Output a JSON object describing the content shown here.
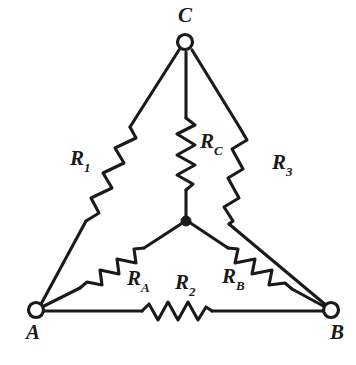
{
  "figure": {
    "kind": "circuit-diagram",
    "background_color": "#ffffff",
    "stroke_color": "#1a1a1a"
  },
  "nodes": [
    {
      "id": "A",
      "label": "A",
      "marker": "open-circle",
      "x": 36,
      "y": 310
    },
    {
      "id": "B",
      "label": "B",
      "marker": "open-circle",
      "x": 331,
      "y": 310
    },
    {
      "id": "C",
      "label": "C",
      "marker": "open-circle",
      "x": 185,
      "y": 42
    },
    {
      "id": "N",
      "label": "",
      "marker": "filled-dot",
      "x": 186,
      "y": 221
    }
  ],
  "node_labels": [
    {
      "name": "node-label-a",
      "text": "A",
      "x": 26,
      "y": 322
    },
    {
      "name": "node-label-b",
      "text": "B",
      "x": 330,
      "y": 322
    },
    {
      "name": "node-label-c",
      "text": "C",
      "x": 178,
      "y": 5
    }
  ],
  "resistors": [
    {
      "id": "R1",
      "base": "R",
      "subscript": "1",
      "network": "delta",
      "between": [
        "A",
        "C"
      ],
      "label_x": 70,
      "label_y": 148
    },
    {
      "id": "R2",
      "base": "R",
      "subscript": "2",
      "network": "delta",
      "between": [
        "A",
        "B"
      ],
      "label_x": 175,
      "label_y": 272
    },
    {
      "id": "R3",
      "base": "R",
      "subscript": "3",
      "network": "delta",
      "between": [
        "C",
        "B"
      ],
      "label_x": 272,
      "label_y": 152
    },
    {
      "id": "RA",
      "base": "R",
      "subscript": "A",
      "network": "wye",
      "between": [
        "N",
        "A"
      ],
      "label_x": 127,
      "label_y": 268
    },
    {
      "id": "RB",
      "base": "R",
      "subscript": "B",
      "network": "wye",
      "between": [
        "N",
        "B"
      ],
      "label_x": 222,
      "label_y": 266
    },
    {
      "id": "RC",
      "base": "R",
      "subscript": "C",
      "network": "wye",
      "between": [
        "N",
        "C"
      ],
      "label_x": 200,
      "label_y": 131
    }
  ]
}
